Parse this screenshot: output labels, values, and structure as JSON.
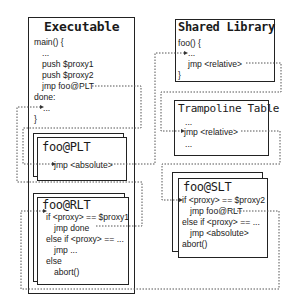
{
  "executable": {
    "title": "Executable",
    "lines": [
      "main() {",
      "...",
      "push $proxy1",
      "push $proxy2",
      "jmp foo@PLT",
      "done:",
      "...",
      "}"
    ]
  },
  "plt": {
    "title": "foo@PLT",
    "lines": [
      "jmp <absolute>"
    ]
  },
  "rlt": {
    "title": "foo@RLT",
    "lines": [
      "if <proxy> == $proxy1",
      "jmp done",
      "else if <proxy> == ...",
      "jmp ...",
      "else",
      "abort()"
    ]
  },
  "shared_library": {
    "title": "Shared Library",
    "lines": [
      "foo() {",
      "...",
      "jmp <relative>",
      "}"
    ]
  },
  "trampoline": {
    "title": "Trampoline Table",
    "lines": [
      "...",
      "jmp <relative>",
      "..."
    ]
  },
  "slt": {
    "title": "foo@SLT",
    "lines": [
      "if <proxy> == $proxy2",
      "jmp foo@RLT",
      "else if <proxy> == ...",
      "jmp <absolute>",
      "abort()"
    ]
  },
  "colors": {
    "line": "#222222",
    "dotted": "#555555",
    "background": "#ffffff"
  }
}
